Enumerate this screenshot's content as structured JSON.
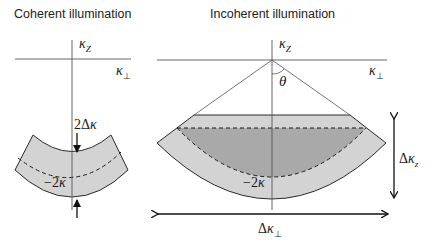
{
  "panels": [
    {
      "id": "coherent",
      "title": "Coherent illumination",
      "axes": {
        "vertical_label": "κ",
        "vertical_sub": "Z",
        "horizontal_label": "κ",
        "horizontal_sub": "⊥"
      },
      "labels": {
        "thickness_prefix": "2Δ",
        "thickness_var": "κ",
        "center_prefix": "−2",
        "center_var": "κ"
      }
    },
    {
      "id": "incoherent",
      "title": "Incoherent illumination",
      "axes": {
        "vertical_label": "κ",
        "vertical_sub": "Z",
        "horizontal_label": "κ",
        "horizontal_sub": "⊥"
      },
      "labels": {
        "angle": "θ",
        "center_prefix": "−2",
        "center_var": "κ",
        "dz_prefix": "Δ",
        "dz_var": "κ",
        "dz_sub": "z",
        "dperp_prefix": "Δ",
        "dperp_var": "κ",
        "dperp_sub": "⊥"
      }
    }
  ],
  "colors": {
    "band_fill": "#d3d3d3",
    "inner_fill": "#a9a9a9",
    "stroke": "#1a1a1a",
    "axis": "#555555"
  }
}
